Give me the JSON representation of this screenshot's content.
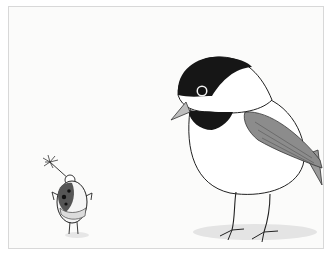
{
  "illustration": {
    "description": "Pencil-style illustration of a small bug holding a dandelion-like flower looking up at a large chickadee bird",
    "characters": [
      {
        "name": "bug",
        "position": "bottom-left",
        "holding": "flower"
      },
      {
        "name": "chickadee",
        "position": "right",
        "colors": {
          "cap": "#1a1a1a",
          "wing": "#8a8a8a",
          "body": "#ffffff"
        }
      }
    ],
    "colors": {
      "background": "#fbfbfa",
      "border": "#d8d8d8",
      "ink": "#1a1a1a",
      "shadow": "#e6e6e6"
    }
  }
}
